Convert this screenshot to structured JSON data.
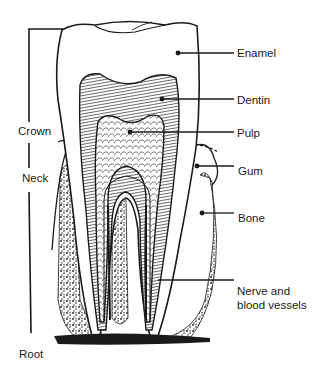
{
  "diagram": {
    "colors": {
      "ink": "#1a1a1a",
      "background": "#ffffff"
    },
    "labels_right": [
      {
        "id": "enamel",
        "text": "Enamel"
      },
      {
        "id": "dentin",
        "text": "Dentin"
      },
      {
        "id": "pulp",
        "text": "Pulp"
      },
      {
        "id": "gum",
        "text": "Gum"
      },
      {
        "id": "bone",
        "text": "Bone"
      },
      {
        "id": "nerve",
        "text": "Nerve and\nblood vessels"
      }
    ],
    "labels_left": [
      {
        "id": "crown",
        "text": "Crown"
      },
      {
        "id": "neck",
        "text": "Neck"
      },
      {
        "id": "root",
        "text": "Root"
      }
    ]
  }
}
